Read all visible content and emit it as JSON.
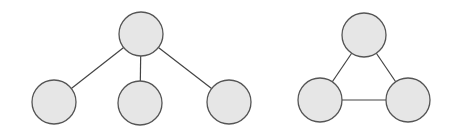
{
  "diagram": {
    "node_fill": "#e6e6e6",
    "node_stroke": "#555555",
    "edge_color": "#444444",
    "tree": {
      "nodes": [
        {
          "id": "root",
          "cx": 141,
          "cy": 34,
          "r": 22
        },
        {
          "id": "child-left",
          "cx": 54,
          "cy": 102,
          "r": 22
        },
        {
          "id": "child-middle",
          "cx": 140,
          "cy": 103,
          "r": 22
        },
        {
          "id": "child-right",
          "cx": 229,
          "cy": 102,
          "r": 22
        }
      ],
      "edges": [
        [
          "root",
          "child-left"
        ],
        [
          "root",
          "child-middle"
        ],
        [
          "root",
          "child-right"
        ]
      ]
    },
    "triangle": {
      "nodes": [
        {
          "id": "top",
          "cx": 364,
          "cy": 35,
          "r": 22
        },
        {
          "id": "bottom-left",
          "cx": 320,
          "cy": 100,
          "r": 22
        },
        {
          "id": "bottom-right",
          "cx": 408,
          "cy": 100,
          "r": 22
        }
      ],
      "edges": [
        [
          "top",
          "bottom-left"
        ],
        [
          "top",
          "bottom-right"
        ],
        [
          "bottom-left",
          "bottom-right"
        ]
      ]
    }
  }
}
